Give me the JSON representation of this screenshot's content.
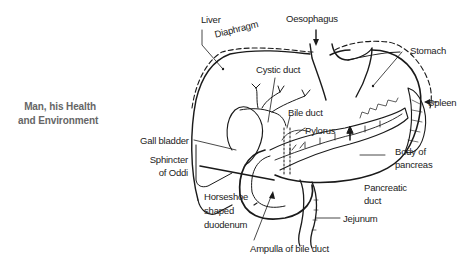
{
  "book_title": {
    "line1": "Man, his Health",
    "line2": "and Environment"
  },
  "diagram": {
    "labels": {
      "liver": "Liver",
      "diaphragm": "Diaphragm",
      "oesophagus": "Oesophagus",
      "stomach": "Stomach",
      "cystic_duct": "Cystic duct",
      "spleen": "Spleen",
      "bile_duct": "Bile duct",
      "pylorus": "Pylorus",
      "gall_bladder": "Gall bladder",
      "sphincter_line1": "Sphincter",
      "sphincter_line2": "of Oddi",
      "body_of_pancreas_line1": "Body of",
      "body_of_pancreas_line2": "pancreas",
      "pancreatic_duct_line1": "Pancreatic",
      "pancreatic_duct_line2": "duct",
      "horseshoe_line1": "Horseshoe",
      "horseshoe_line2": "shaped",
      "horseshoe_line3": "duodenum",
      "jejunum": "Jejunum",
      "ampulla": "Ampulla of bile duct"
    },
    "colors": {
      "line": "#1a1a1a",
      "side_title": "#666666"
    }
  }
}
